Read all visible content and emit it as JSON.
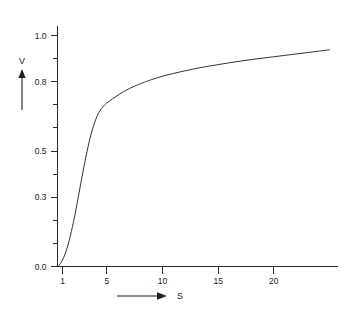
{
  "chart_data": {
    "type": "line",
    "title": "",
    "subtitle": "",
    "xlabel": "S",
    "ylabel": "V",
    "xlim": [
      0.55,
      25.0
    ],
    "ylim": [
      0.0,
      1.0
    ],
    "grid": false,
    "legend": null,
    "x_ticks_labeled": [
      1,
      5,
      10,
      15,
      20
    ],
    "x_tick_labels": [
      "1",
      "5",
      "10",
      "15",
      "20"
    ],
    "y_ticks_labeled": [
      0.0,
      0.3,
      0.5,
      0.8,
      1.0
    ],
    "y_tick_labels": [
      "0.0",
      "0.3",
      "0.5",
      "0.8",
      "1.0"
    ],
    "y_minor_ticks": [
      0.1,
      0.2,
      0.4,
      0.6,
      0.7,
      0.9
    ],
    "series": [
      {
        "name": "V(S)",
        "color": "#333333",
        "x": [
          0.6,
          0.8,
          1.0,
          1.2,
          1.4,
          1.6,
          1.8,
          2.0,
          2.2,
          2.4,
          2.6,
          2.8,
          3.0,
          3.2,
          3.4,
          3.6,
          3.8,
          4.0,
          4.2,
          4.4,
          4.6,
          4.8,
          5.0,
          5.5,
          6.0,
          6.5,
          7.0,
          7.5,
          8.0,
          9.0,
          10.0,
          11.0,
          12.0,
          13.0,
          14.0,
          15.0,
          16.0,
          17.0,
          18.0,
          19.0,
          20.0,
          21.0,
          22.0,
          23.0,
          24.0,
          25.0
        ],
        "y": [
          0.0,
          0.012,
          0.028,
          0.05,
          0.078,
          0.112,
          0.152,
          0.196,
          0.244,
          0.295,
          0.348,
          0.4,
          0.45,
          0.497,
          0.54,
          0.578,
          0.61,
          0.638,
          0.66,
          0.677,
          0.69,
          0.7,
          0.708,
          0.726,
          0.742,
          0.757,
          0.77,
          0.781,
          0.791,
          0.809,
          0.824,
          0.836,
          0.847,
          0.857,
          0.866,
          0.874,
          0.882,
          0.889,
          0.896,
          0.902,
          0.908,
          0.914,
          0.92,
          0.926,
          0.932,
          0.938
        ]
      }
    ],
    "annotations": [
      {
        "name": "y-axis-arrow",
        "label": "V",
        "direction": "up"
      },
      {
        "name": "x-axis-arrow",
        "label": "S",
        "direction": "right"
      }
    ]
  },
  "figure": {
    "background_color": "#ffffff",
    "axis_color": "#2b2b2b",
    "curve_color": "#333333"
  }
}
